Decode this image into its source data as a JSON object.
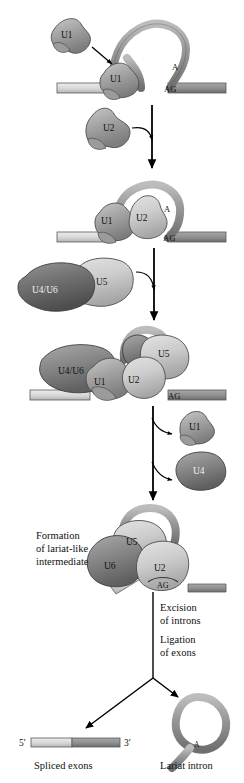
{
  "figure": {
    "background_color": "#ffffff",
    "ink_color": "#101010"
  },
  "palette": {
    "snrnp_light": "#cfcfcf",
    "snrnp_mid": "#a8a8a8",
    "snrnp_dark": "#8a8a8a",
    "snrnp_darker": "#6f6f6f",
    "rna_gray": "#9a9a9a",
    "exon_left": "#d9d9d9",
    "exon_right": "#8f8f8f",
    "outline": "#3a3a3a",
    "arrow": "#000000"
  },
  "steps": [
    {
      "id": "step-1",
      "name": "u1-binding",
      "particles": [
        {
          "label": "U1",
          "name": "u1-free",
          "shade": "snrnp_mid"
        },
        {
          "label": "U1",
          "name": "u1-bound",
          "shade": "snrnp_mid"
        },
        {
          "label": "U2",
          "name": "u2-free",
          "shade": "snrnp_mid"
        }
      ],
      "rna_labels": [
        {
          "text": "A",
          "name": "branch-point-a"
        },
        {
          "text": "AG",
          "name": "three-prime-splice-site-ag"
        }
      ]
    },
    {
      "id": "step-2",
      "name": "u1-u2-complex",
      "particles": [
        {
          "label": "U1",
          "name": "u1-in-complex",
          "shade": "snrnp_mid"
        },
        {
          "label": "U2",
          "name": "u2-in-complex",
          "shade": "snrnp_light"
        },
        {
          "label": "U4/U6",
          "name": "u4-u6-free",
          "shade": "snrnp_darker"
        },
        {
          "label": "U5",
          "name": "u5-free",
          "shade": "snrnp_light"
        }
      ],
      "rna_labels": [
        {
          "text": "A",
          "name": "branch-point-a"
        },
        {
          "text": "AG",
          "name": "three-prime-splice-site-ag"
        }
      ]
    },
    {
      "id": "step-3",
      "name": "full-spliceosome",
      "particles": [
        {
          "label": "U4/U6",
          "name": "u4-u6-in-complex",
          "shade": "snrnp_dark"
        },
        {
          "label": "U5",
          "name": "u5-in-complex",
          "shade": "snrnp_light"
        },
        {
          "label": "U1",
          "name": "u1-in-complex",
          "shade": "snrnp_mid"
        },
        {
          "label": "U2",
          "name": "u2-in-complex",
          "shade": "snrnp_light"
        }
      ],
      "rna_labels": [
        {
          "text": "AG",
          "name": "three-prime-splice-site-ag"
        }
      ],
      "released": [
        {
          "label": "U1",
          "name": "u1-released",
          "shade": "snrnp_mid"
        },
        {
          "label": "U4",
          "name": "u4-released",
          "shade": "snrnp_dark"
        }
      ]
    },
    {
      "id": "step-4",
      "name": "lariat-intermediate",
      "caption": "Formation\nof lariat-like\nintermediate",
      "caption_lines": [
        "Formation",
        "of lariat-like",
        "intermediate"
      ],
      "particles": [
        {
          "label": "U5",
          "name": "u5-in-lariat-complex",
          "shade": "snrnp_light"
        },
        {
          "label": "U6",
          "name": "u6-in-lariat-complex",
          "shade": "snrnp_dark"
        },
        {
          "label": "U2",
          "name": "u2-in-lariat-complex",
          "shade": "snrnp_light"
        }
      ],
      "rna_labels": [
        {
          "text": "AG",
          "name": "three-prime-splice-site-ag"
        }
      ]
    },
    {
      "id": "step-5",
      "name": "excision-and-ligation",
      "caption_lines": [
        "Excision",
        "of introns",
        "Ligation",
        "of exons"
      ]
    }
  ],
  "products": [
    {
      "name": "spliced-exons",
      "label": "Spliced exons",
      "five_prime": "5′",
      "three_prime": "3′"
    },
    {
      "name": "lariat-intron",
      "label": "Lariat intron",
      "branch_label": "A"
    }
  ],
  "labels": {
    "u1": "U1",
    "u2": "U2",
    "u4": "U4",
    "u5": "U5",
    "u6": "U6",
    "u4_u6": "U4/U6",
    "a": "A",
    "ag": "AG",
    "five_prime": "5′",
    "three_prime": "3′",
    "formation_l1": "Formation",
    "formation_l2": "of lariat-like",
    "formation_l3": "intermediate",
    "excision_l1": "Excision",
    "excision_l2": "of introns",
    "ligation_l1": "Ligation",
    "ligation_l2": "of exons",
    "spliced_exons": "Spliced exons",
    "lariat_intron": "Lariat intron"
  }
}
